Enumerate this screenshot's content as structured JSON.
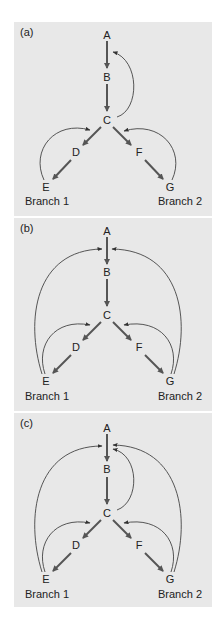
{
  "figure": {
    "panels": [
      {
        "id": "a",
        "label": "(a)",
        "nodes": {
          "A": "A",
          "B": "B",
          "C": "C",
          "D": "D",
          "E": "E",
          "F": "F",
          "G": "G"
        },
        "branch_labels": {
          "left": "Branch 1",
          "right": "Branch 2"
        },
        "forward_edges": [
          [
            "A",
            "B"
          ],
          [
            "B",
            "C"
          ],
          [
            "C",
            "D"
          ],
          [
            "D",
            "E"
          ],
          [
            "C",
            "F"
          ],
          [
            "F",
            "G"
          ]
        ],
        "feedback_edges": [
          [
            "C",
            "A-B"
          ],
          [
            "E",
            "C-D"
          ],
          [
            "G",
            "C-F"
          ]
        ]
      },
      {
        "id": "b",
        "label": "(b)",
        "nodes": {
          "A": "A",
          "B": "B",
          "C": "C",
          "D": "D",
          "E": "E",
          "F": "F",
          "G": "G"
        },
        "branch_labels": {
          "left": "Branch 1",
          "right": "Branch 2"
        },
        "forward_edges": [
          [
            "A",
            "B"
          ],
          [
            "B",
            "C"
          ],
          [
            "C",
            "D"
          ],
          [
            "D",
            "E"
          ],
          [
            "C",
            "F"
          ],
          [
            "F",
            "G"
          ]
        ],
        "feedback_edges": [
          [
            "E",
            "A-B"
          ],
          [
            "G",
            "A-B"
          ],
          [
            "E",
            "C-D"
          ],
          [
            "G",
            "C-F"
          ]
        ]
      },
      {
        "id": "c",
        "label": "(c)",
        "nodes": {
          "A": "A",
          "B": "B",
          "C": "C",
          "D": "D",
          "E": "E",
          "F": "F",
          "G": "G"
        },
        "branch_labels": {
          "left": "Branch 1",
          "right": "Branch 2"
        },
        "forward_edges": [
          [
            "A",
            "B"
          ],
          [
            "B",
            "C"
          ],
          [
            "C",
            "D"
          ],
          [
            "D",
            "E"
          ],
          [
            "C",
            "F"
          ],
          [
            "F",
            "G"
          ]
        ],
        "feedback_edges": [
          [
            "C",
            "A-B"
          ],
          [
            "E",
            "A-B"
          ],
          [
            "G",
            "A-B"
          ],
          [
            "E",
            "C-D"
          ],
          [
            "G",
            "C-F"
          ]
        ]
      }
    ],
    "colors": {
      "panel_bg": "#e8e8e8",
      "page_bg": "#ffffff",
      "arrow": "#555555",
      "text": "#222222"
    }
  }
}
